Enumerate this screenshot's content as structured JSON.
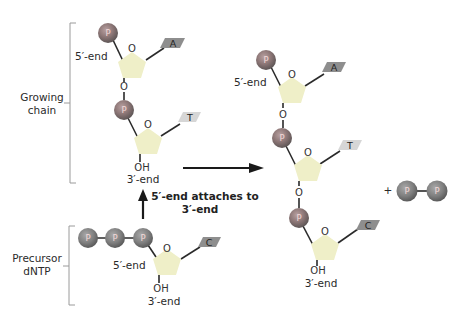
{
  "colors": {
    "phosphate": "#8a8a8a",
    "phosphate_highlight": "#b05a5a",
    "sugar": "#efefc8",
    "base_dark": "#8e8e8e",
    "base_light": "#d6d6d6",
    "arrow": "#1a1a1a"
  },
  "labels": {
    "growing_chain_line1": "Growing",
    "growing_chain_line2": "chain",
    "precursor_line1": "Precursor",
    "precursor_line2": "dNTP",
    "arrow_caption_line1": "5′-end attaches to",
    "arrow_caption_line2": "3′-end",
    "five_end": "5′-end",
    "three_end": "3′-end",
    "oh": "OH",
    "ring_o": "O",
    "link_o": "O",
    "phosphate": "P",
    "plus": "+"
  },
  "growing_chain": {
    "bases": [
      "A",
      "T"
    ]
  },
  "precursor": {
    "phosphate_count": 3,
    "base": "C"
  },
  "product_chain": {
    "bases": [
      "A",
      "T",
      "C"
    ]
  },
  "byproduct": {
    "name": "pyrophosphate",
    "phosphate_count": 2
  },
  "icons": {
    "reaction_arrow": "right-arrow-icon",
    "attach_arrow": "up-arrow-icon"
  }
}
